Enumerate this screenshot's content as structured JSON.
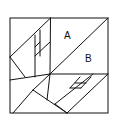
{
  "diagram": {
    "type": "geometric-dissection-square",
    "labels": [
      {
        "id": "A",
        "text": "A"
      },
      {
        "id": "B",
        "text": "B"
      }
    ],
    "colors": {
      "stroke": "#111111",
      "background": "#ffffff"
    }
  }
}
